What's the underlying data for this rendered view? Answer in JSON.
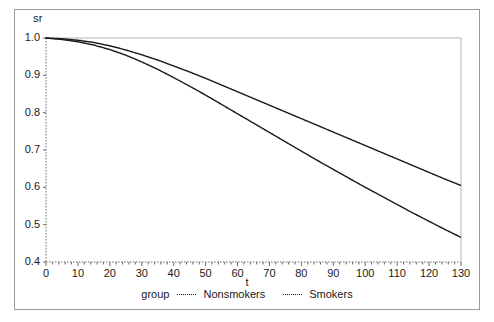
{
  "chart_data": {
    "type": "line",
    "title": "",
    "xlabel": "t",
    "ylabel": "sr",
    "xlim": [
      0,
      130
    ],
    "ylim": [
      0.4,
      1.0
    ],
    "xticks": [
      0,
      10,
      20,
      30,
      40,
      50,
      60,
      70,
      80,
      90,
      100,
      110,
      120,
      130
    ],
    "yticks": [
      "1.0",
      "0.9",
      "0.8",
      "0.7",
      "0.6",
      "0.5",
      "0.4"
    ],
    "grid": false,
    "legend_position": "bottom-center",
    "legend_title": "group",
    "line_style": "dotted",
    "line_color": "#1a1a1a",
    "x": [
      0,
      5,
      10,
      15,
      20,
      25,
      30,
      35,
      40,
      45,
      50,
      55,
      60,
      65,
      70,
      75,
      80,
      85,
      90,
      95,
      100,
      105,
      110,
      115,
      120,
      125,
      130
    ],
    "series": [
      {
        "name": "Nonsmokers",
        "values": [
          1.0,
          0.998,
          0.994,
          0.988,
          0.979,
          0.968,
          0.955,
          0.941,
          0.925,
          0.909,
          0.892,
          0.874,
          0.856,
          0.838,
          0.82,
          0.802,
          0.784,
          0.766,
          0.748,
          0.73,
          0.712,
          0.694,
          0.676,
          0.658,
          0.64,
          0.622,
          0.605
        ]
      },
      {
        "name": "Smokers",
        "values": [
          1.0,
          0.996,
          0.99,
          0.981,
          0.969,
          0.954,
          0.936,
          0.916,
          0.894,
          0.871,
          0.847,
          0.822,
          0.797,
          0.772,
          0.747,
          0.722,
          0.697,
          0.672,
          0.648,
          0.624,
          0.6,
          0.577,
          0.554,
          0.531,
          0.509,
          0.487,
          0.466
        ]
      }
    ]
  },
  "axes": {
    "ylabel": "sr",
    "xlabel": "t",
    "ytick_labels": [
      "1.0",
      "0.9",
      "0.8",
      "0.7",
      "0.6",
      "0.5",
      "0.4"
    ],
    "xtick_labels": [
      "0",
      "10",
      "20",
      "30",
      "40",
      "50",
      "60",
      "70",
      "80",
      "90",
      "100",
      "110",
      "120",
      "130"
    ]
  },
  "legend": {
    "title": "group",
    "entries": [
      {
        "label": "Nonsmokers"
      },
      {
        "label": "Smokers"
      }
    ]
  },
  "colors": {
    "line": "#1a1a1a",
    "axis": "#6b6b6b",
    "frame": "#9a9a9a",
    "background": "#ffffff"
  }
}
